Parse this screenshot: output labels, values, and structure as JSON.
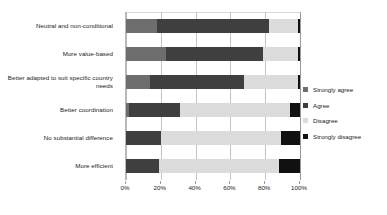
{
  "chart_data": {
    "type": "bar",
    "orientation": "horizontal",
    "stacked": true,
    "normalized": true,
    "title": "",
    "subtitle": "",
    "xlabel": "",
    "ylabel": "",
    "xlim": [
      0,
      100
    ],
    "xtick_labels": [
      "0%",
      "20%",
      "40%",
      "60%",
      "80%",
      "100%"
    ],
    "xtick_values": [
      0,
      20,
      40,
      60,
      80,
      100
    ],
    "grid": true,
    "legend_position": "right",
    "categories": [
      "Neutral and non-conditional",
      "More value-based",
      "Better adapted to suit specific country needs",
      "Better coordination",
      "No substantial difference",
      "More efficient"
    ],
    "series": [
      {
        "name": "Strongly agree",
        "color": "#6e6e6e",
        "values": [
          18,
          23,
          14,
          2,
          0,
          0
        ]
      },
      {
        "name": "Agree",
        "color": "#3f3f3f",
        "values": [
          64,
          56,
          54,
          29,
          20,
          19
        ]
      },
      {
        "name": "Disagree",
        "color": "#dcdcdc",
        "values": [
          17,
          20,
          31,
          63,
          69,
          69
        ]
      },
      {
        "name": "Strongly disagree",
        "color": "#111111",
        "values": [
          1,
          1,
          1,
          6,
          11,
          12
        ]
      }
    ]
  },
  "axis": {
    "tick_labels": [
      "0%",
      "20%",
      "40%",
      "60%",
      "80%",
      "100%"
    ]
  },
  "legend": {
    "items": [
      {
        "label": "Strongly agree",
        "color": "#6e6e6e"
      },
      {
        "label": "Agree",
        "color": "#3f3f3f"
      },
      {
        "label": "Disagree",
        "color": "#dcdcdc"
      },
      {
        "label": "Strongly disagree",
        "color": "#111111"
      }
    ]
  },
  "categories": [
    {
      "label": "Neutral and non-conditional"
    },
    {
      "label": "More value-based"
    },
    {
      "label": "Better adapted to suit specific country needs"
    },
    {
      "label": "Better coordination"
    },
    {
      "label": "No substantial difference"
    },
    {
      "label": "More efficient"
    }
  ]
}
